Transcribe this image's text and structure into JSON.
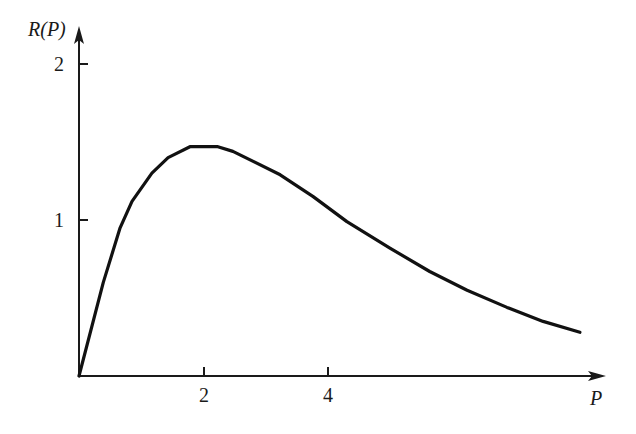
{
  "chart_data": {
    "type": "line",
    "title": "",
    "xlabel": "P",
    "ylabel": "R(P)",
    "x_ticks": [
      "2",
      "4"
    ],
    "y_ticks": [
      "1",
      "2"
    ],
    "xlim": [
      0,
      8.3
    ],
    "ylim": [
      0,
      2.0
    ],
    "grid": false,
    "legend": null,
    "series": [
      {
        "name": "R(P)",
        "x": [
          0,
          0.39,
          0.66,
          0.85,
          1.17,
          1.43,
          1.78,
          2.23,
          2.47,
          3.23,
          3.76,
          4.3,
          4.99,
          5.63,
          6.23,
          6.87,
          7.45,
          8.04
        ],
        "y": [
          0,
          0.6,
          0.95,
          1.12,
          1.3,
          1.4,
          1.47,
          1.47,
          1.44,
          1.29,
          1.15,
          0.99,
          0.82,
          0.67,
          0.55,
          0.44,
          0.35,
          0.28
        ]
      }
    ],
    "colors": {
      "line": "#111111",
      "axes": "#1a1a1a"
    }
  },
  "labels": {
    "ylabel": "R(P)",
    "xlabel": "P",
    "ytick_2": "2",
    "ytick_1": "1",
    "xtick_2": "2",
    "xtick_4": "4"
  }
}
